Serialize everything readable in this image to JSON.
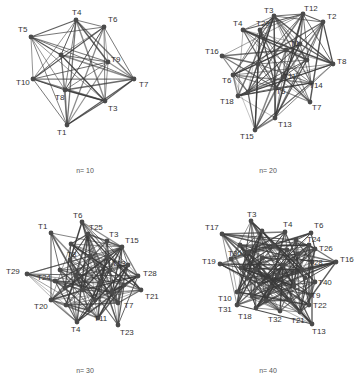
{
  "figure": {
    "panels": [
      {
        "id": "n10",
        "caption": "n= 10",
        "caption_pos": [
          85,
          172
        ],
        "nodes": [
          {
            "label": "T4",
            "x": 76,
            "y": 20,
            "lx": -4,
            "ly": -5
          },
          {
            "label": "T6",
            "x": 104,
            "y": 27,
            "lx": 4,
            "ly": -5
          },
          {
            "label": "T5",
            "x": 31,
            "y": 37,
            "lx": -13,
            "ly": -5
          },
          {
            "label": "T9",
            "x": 108,
            "y": 62,
            "lx": 3,
            "ly": 0
          },
          {
            "label": "T7",
            "x": 134,
            "y": 79,
            "lx": 5,
            "ly": 8
          },
          {
            "label": "T10",
            "x": 33,
            "y": 79,
            "lx": -17,
            "ly": 6
          },
          {
            "label": "T8",
            "x": 65,
            "y": 90,
            "lx": -10,
            "ly": 10
          },
          {
            "label": "T3",
            "x": 105,
            "y": 101,
            "lx": 3,
            "ly": 10
          },
          {
            "label": "T1",
            "x": 67,
            "y": 125,
            "lx": -10,
            "ly": 10
          },
          {
            "label": "T2",
            "x": 61,
            "y": 55,
            "lx": 0,
            "ly": 0,
            "hidden_label": true
          }
        ],
        "density": 1.0
      },
      {
        "id": "n20",
        "caption": "n= 20",
        "caption_pos": [
          268,
          172
        ],
        "nodes": [
          {
            "label": "T3",
            "x": 274,
            "y": 16,
            "lx": -10,
            "ly": -3
          },
          {
            "label": "T12",
            "x": 303,
            "y": 14,
            "lx": 1,
            "ly": -3
          },
          {
            "label": "T2",
            "x": 323,
            "y": 22,
            "lx": 4,
            "ly": -3
          },
          {
            "label": "T4",
            "x": 243,
            "y": 30,
            "lx": -10,
            "ly": -4
          },
          {
            "label": "T20",
            "x": 260,
            "y": 30,
            "lx": -4,
            "ly": -4
          },
          {
            "label": "T16",
            "x": 222,
            "y": 56,
            "lx": -17,
            "ly": -2
          },
          {
            "label": "T8",
            "x": 333,
            "y": 64,
            "lx": 4,
            "ly": 0
          },
          {
            "label": "T6",
            "x": 233,
            "y": 75,
            "lx": -11,
            "ly": 8
          },
          {
            "label": "T18",
            "x": 238,
            "y": 96,
            "lx": -18,
            "ly": 8
          },
          {
            "label": "T14",
            "x": 311,
            "y": 83,
            "lx": -2,
            "ly": 5
          },
          {
            "label": "T7",
            "x": 310,
            "y": 102,
            "lx": 2,
            "ly": 8
          },
          {
            "label": "T13",
            "x": 275,
            "y": 118,
            "lx": 3,
            "ly": 9
          },
          {
            "label": "T15",
            "x": 255,
            "y": 130,
            "lx": -15,
            "ly": 9
          },
          {
            "label": "T1",
            "x": 300,
            "y": 44,
            "lx": -10,
            "ly": 2
          },
          {
            "label": "T11",
            "x": 283,
            "y": 77,
            "lx": 0,
            "ly": 2
          },
          {
            "label": "T5",
            "x": 276,
            "y": 88,
            "lx": 0,
            "ly": 6
          },
          {
            "label": "T9",
            "x": 307,
            "y": 60,
            "lx": 0,
            "ly": 0,
            "hidden_label": true
          },
          {
            "label": "T10",
            "x": 258,
            "y": 64,
            "lx": 0,
            "ly": 0,
            "hidden_label": true
          },
          {
            "label": "T17",
            "x": 248,
            "y": 92,
            "lx": 0,
            "ly": 0,
            "hidden_label": true
          },
          {
            "label": "T19",
            "x": 286,
            "y": 50,
            "lx": 0,
            "ly": 0,
            "hidden_label": true
          }
        ],
        "density": 0.55
      },
      {
        "id": "n30",
        "caption": "n= 30",
        "caption_pos": [
          85,
          372
        ],
        "nodes": [
          {
            "label": "T6",
            "x": 82,
            "y": 222,
            "lx": -9,
            "ly": -4
          },
          {
            "label": "T1",
            "x": 51,
            "y": 233,
            "lx": -13,
            "ly": -4
          },
          {
            "label": "T25",
            "x": 88,
            "y": 234,
            "lx": 1,
            "ly": -4
          },
          {
            "label": "T3",
            "x": 107,
            "y": 241,
            "lx": 2,
            "ly": -4
          },
          {
            "label": "T15",
            "x": 122,
            "y": 247,
            "lx": 3,
            "ly": -4
          },
          {
            "label": "T29",
            "x": 27,
            "y": 274,
            "lx": -21,
            "ly": 0
          },
          {
            "label": "T28",
            "x": 138,
            "y": 276,
            "lx": 5,
            "ly": 0
          },
          {
            "label": "T21",
            "x": 141,
            "y": 290,
            "lx": 4,
            "ly": 9
          },
          {
            "label": "T20",
            "x": 51,
            "y": 300,
            "lx": -17,
            "ly": 9
          },
          {
            "label": "T4",
            "x": 77,
            "y": 322,
            "lx": -6,
            "ly": 10
          },
          {
            "label": "T23",
            "x": 118,
            "y": 325,
            "lx": 2,
            "ly": 10
          },
          {
            "label": "T24",
            "x": 55,
            "y": 281,
            "lx": -18,
            "ly": -1
          },
          {
            "label": "T13",
            "x": 110,
            "y": 270,
            "lx": 2,
            "ly": -4
          },
          {
            "label": "T7",
            "x": 118,
            "y": 303,
            "lx": 6,
            "ly": 5
          },
          {
            "label": "T11",
            "x": 98,
            "y": 318,
            "lx": -4,
            "ly": 3
          },
          {
            "label": "T8",
            "x": 70,
            "y": 260,
            "lx": -3,
            "ly": -3
          },
          {
            "label": "T2",
            "x": 71,
            "y": 244,
            "lx": 0,
            "ly": 0,
            "hidden_label": true
          },
          {
            "label": "T5",
            "x": 90,
            "y": 256,
            "lx": 0,
            "ly": 0,
            "hidden_label": true
          },
          {
            "label": "T9",
            "x": 100,
            "y": 283,
            "lx": 0,
            "ly": 0,
            "hidden_label": true
          },
          {
            "label": "T10",
            "x": 83,
            "y": 290,
            "lx": 0,
            "ly": 0,
            "hidden_label": true
          },
          {
            "label": "T12",
            "x": 66,
            "y": 305,
            "lx": 0,
            "ly": 0,
            "hidden_label": true
          },
          {
            "label": "T14",
            "x": 124,
            "y": 285,
            "lx": 0,
            "ly": 0,
            "hidden_label": true
          },
          {
            "label": "T16",
            "x": 60,
            "y": 270,
            "lx": 0,
            "ly": 0,
            "hidden_label": true
          },
          {
            "label": "T17",
            "x": 95,
            "y": 300,
            "lx": 0,
            "ly": 0,
            "hidden_label": true
          },
          {
            "label": "T18",
            "x": 76,
            "y": 276,
            "lx": 0,
            "ly": 0,
            "hidden_label": true
          },
          {
            "label": "T19",
            "x": 108,
            "y": 257,
            "lx": 0,
            "ly": 0,
            "hidden_label": true
          },
          {
            "label": "T22",
            "x": 128,
            "y": 265,
            "lx": 0,
            "ly": 0,
            "hidden_label": true
          },
          {
            "label": "T26",
            "x": 88,
            "y": 310,
            "lx": 0,
            "ly": 0,
            "hidden_label": true
          },
          {
            "label": "T27",
            "x": 112,
            "y": 292,
            "lx": 0,
            "ly": 0,
            "hidden_label": true
          },
          {
            "label": "T30",
            "x": 65,
            "y": 288,
            "lx": 0,
            "ly": 0,
            "hidden_label": true
          }
        ],
        "density": 0.35
      },
      {
        "id": "n40",
        "caption": "n= 40",
        "caption_pos": [
          268,
          372
        ],
        "nodes": [
          {
            "label": "T3",
            "x": 251,
            "y": 221,
            "lx": -4,
            "ly": -4
          },
          {
            "label": "T17",
            "x": 222,
            "y": 234,
            "lx": -17,
            "ly": -4
          },
          {
            "label": "T4",
            "x": 285,
            "y": 232,
            "lx": -2,
            "ly": -5
          },
          {
            "label": "T6",
            "x": 311,
            "y": 233,
            "lx": 3,
            "ly": -5
          },
          {
            "label": "T26",
            "x": 315,
            "y": 249,
            "lx": 4,
            "ly": 2
          },
          {
            "label": "T24",
            "x": 309,
            "y": 245,
            "lx": -2,
            "ly": -3
          },
          {
            "label": "T19",
            "x": 220,
            "y": 264,
            "lx": -18,
            "ly": 0
          },
          {
            "label": "T30",
            "x": 231,
            "y": 259,
            "lx": -3,
            "ly": -3
          },
          {
            "label": "T16",
            "x": 336,
            "y": 262,
            "lx": 4,
            "ly": 0
          },
          {
            "label": "T40",
            "x": 315,
            "y": 282,
            "lx": 3,
            "ly": 3
          },
          {
            "label": "T10",
            "x": 237,
            "y": 292,
            "lx": -19,
            "ly": 9
          },
          {
            "label": "T31",
            "x": 237,
            "y": 305,
            "lx": -19,
            "ly": 7
          },
          {
            "label": "T18",
            "x": 256,
            "y": 308,
            "lx": -18,
            "ly": 11
          },
          {
            "label": "T22",
            "x": 309,
            "y": 305,
            "lx": 4,
            "ly": 3
          },
          {
            "label": "T32",
            "x": 280,
            "y": 311,
            "lx": -12,
            "ly": 11
          },
          {
            "label": "T21",
            "x": 300,
            "y": 312,
            "lx": -9,
            "ly": 11
          },
          {
            "label": "T13",
            "x": 312,
            "y": 324,
            "lx": 0,
            "ly": 10
          },
          {
            "label": "T9",
            "x": 311,
            "y": 295,
            "lx": 0,
            "ly": 3
          },
          {
            "label": "T28",
            "x": 312,
            "y": 262,
            "lx": -3,
            "ly": 3
          },
          {
            "label": "T1",
            "x": 262,
            "y": 231,
            "lx": 0,
            "ly": 0,
            "hidden_label": true
          },
          {
            "label": "T2",
            "x": 240,
            "y": 245,
            "lx": 0,
            "ly": 0,
            "hidden_label": true
          },
          {
            "label": "T5",
            "x": 296,
            "y": 240,
            "lx": 0,
            "ly": 0,
            "hidden_label": true
          },
          {
            "label": "T7",
            "x": 262,
            "y": 258,
            "lx": 0,
            "ly": 0,
            "hidden_label": true
          },
          {
            "label": "T8",
            "x": 283,
            "y": 265,
            "lx": 0,
            "ly": 0,
            "hidden_label": true
          },
          {
            "label": "T11",
            "x": 247,
            "y": 278,
            "lx": 0,
            "ly": 0,
            "hidden_label": true
          },
          {
            "label": "T12",
            "x": 270,
            "y": 287,
            "lx": 0,
            "ly": 0,
            "hidden_label": true
          },
          {
            "label": "T14",
            "x": 294,
            "y": 286,
            "lx": 0,
            "ly": 0,
            "hidden_label": true
          },
          {
            "label": "T15",
            "x": 302,
            "y": 270,
            "lx": 0,
            "ly": 0,
            "hidden_label": true
          },
          {
            "label": "T20",
            "x": 252,
            "y": 296,
            "lx": 0,
            "ly": 0,
            "hidden_label": true
          },
          {
            "label": "T23",
            "x": 290,
            "y": 300,
            "lx": 0,
            "ly": 0,
            "hidden_label": true
          },
          {
            "label": "T25",
            "x": 274,
            "y": 246,
            "lx": 0,
            "ly": 0,
            "hidden_label": true
          },
          {
            "label": "T27",
            "x": 256,
            "y": 270,
            "lx": 0,
            "ly": 0,
            "hidden_label": true
          },
          {
            "label": "T29",
            "x": 277,
            "y": 275,
            "lx": 0,
            "ly": 0,
            "hidden_label": true
          },
          {
            "label": "T33",
            "x": 241,
            "y": 268,
            "lx": 0,
            "ly": 0,
            "hidden_label": true
          },
          {
            "label": "T34",
            "x": 298,
            "y": 254,
            "lx": 0,
            "ly": 0,
            "hidden_label": true
          },
          {
            "label": "T35",
            "x": 266,
            "y": 301,
            "lx": 0,
            "ly": 0,
            "hidden_label": true
          },
          {
            "label": "T36",
            "x": 287,
            "y": 250,
            "lx": 0,
            "ly": 0,
            "hidden_label": true
          },
          {
            "label": "T37",
            "x": 248,
            "y": 252,
            "lx": 0,
            "ly": 0,
            "hidden_label": true
          },
          {
            "label": "T38",
            "x": 305,
            "y": 278,
            "lx": 0,
            "ly": 0,
            "hidden_label": true
          },
          {
            "label": "T39",
            "x": 260,
            "y": 284,
            "lx": 0,
            "ly": 0,
            "hidden_label": true
          }
        ],
        "density": 0.28
      }
    ],
    "style": {
      "edge_color": "#3a3a3a",
      "node_color": "#4a4a4a",
      "label_color": "#333333",
      "caption_color": "#555555",
      "background": "#ffffff"
    }
  }
}
